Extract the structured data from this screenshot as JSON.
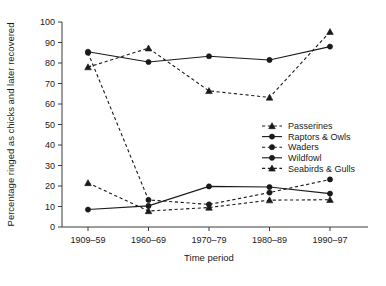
{
  "chart_data": {
    "type": "line",
    "title": "",
    "xlabel": "Time period",
    "ylabel": "Percentage ringed as chicks and later recovered",
    "categories": [
      "1909–59",
      "1960–69",
      "1970–79",
      "1980–89",
      "1990–97"
    ],
    "ylim": [
      0,
      100
    ],
    "yticks": [
      0,
      10,
      20,
      30,
      40,
      50,
      60,
      70,
      80,
      90,
      100
    ],
    "ytick_labels": [
      "0",
      "10",
      "20",
      "30",
      "40",
      "50",
      "60",
      "70",
      "80",
      "90",
      "100"
    ],
    "grid": false,
    "legend_position": "center-right",
    "series": [
      {
        "name": "Passerines",
        "values": [
          21.5,
          7.8,
          9.5,
          13.1,
          13.3
        ],
        "line_style": "dashed",
        "marker": "triangle",
        "color": "#1a1a1a"
      },
      {
        "name": "Raptors & Owls",
        "values": [
          85.5,
          80.5,
          83.3,
          81.5,
          88.0
        ],
        "line_style": "solid",
        "marker": "circle",
        "color": "#1a1a1a"
      },
      {
        "name": "Waders",
        "values": [
          85.0,
          13.2,
          11.0,
          16.8,
          23.2
        ],
        "line_style": "dashed",
        "marker": "circle",
        "color": "#1a1a1a"
      },
      {
        "name": "Wildfowl",
        "values": [
          8.5,
          10.3,
          19.8,
          19.5,
          16.3
        ],
        "line_style": "solid",
        "marker": "circle",
        "color": "#1a1a1a"
      },
      {
        "name": "Seabirds & Gulls",
        "values": [
          78.0,
          87.2,
          66.4,
          63.2,
          95.2
        ],
        "line_style": "dashed",
        "marker": "triangle",
        "color": "#1a1a1a"
      }
    ]
  },
  "legend": {
    "items": [
      {
        "label": "Passerines"
      },
      {
        "label": "Raptors & Owls"
      },
      {
        "label": "Waders"
      },
      {
        "label": "Wildfowl"
      },
      {
        "label": "Seabirds & Gulls"
      }
    ]
  },
  "axes": {
    "x_title": "Time period",
    "y_title": "Percentage ringed as chicks and later recovered"
  }
}
